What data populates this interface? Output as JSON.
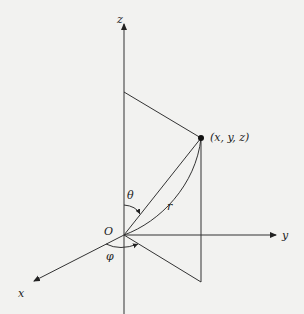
{
  "diagram": {
    "colors": {
      "background": "#f2f2f0",
      "stroke": "#333333",
      "text": "#222222"
    },
    "labels": {
      "z_axis": "z",
      "y_axis": "y",
      "x_axis": "x",
      "origin": "O",
      "point": "(x, y, z)",
      "radius": "r",
      "theta": "θ",
      "phi": "φ"
    },
    "points": {
      "origin": [
        124,
        235
      ],
      "P": [
        201,
        138
      ],
      "z_projection": [
        124,
        92
      ],
      "xy_projection": [
        201,
        282
      ],
      "y_axis_end": [
        278,
        235
      ],
      "z_axis_end": [
        124,
        22
      ],
      "x_axis_end": [
        32,
        282
      ]
    }
  }
}
